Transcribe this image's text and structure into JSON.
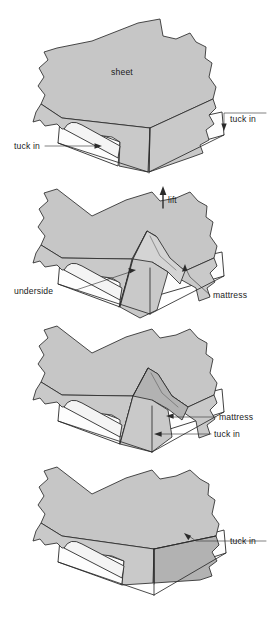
{
  "figure": {
    "panel_count": 4,
    "colors": {
      "sheet_fill": "#c9c9c9",
      "sheet_shadow": "#b2b2b2",
      "sheet_highlight": "#d4d4d4",
      "mattress_fill": "#fdfdfd",
      "outline": "#2b2b2b",
      "background": "#ffffff",
      "label_text": "#1b1b1b"
    }
  },
  "panels": [
    {
      "index": 1,
      "name": "panel-sheet-draped",
      "labels": {
        "sheet": "sheet",
        "tuck_in_right": "tuck in",
        "tuck_in_left": "tuck in"
      }
    },
    {
      "index": 2,
      "name": "panel-lift-fold",
      "labels": {
        "lift": "lift",
        "underside": "underside",
        "mattress": "mattress"
      }
    },
    {
      "index": 3,
      "name": "panel-fold-down",
      "labels": {
        "mattress": "mattress",
        "tuck_in": "tuck in"
      }
    },
    {
      "index": 4,
      "name": "panel-finished-corner",
      "labels": {
        "tuck_in": "tuck in"
      }
    }
  ],
  "icons": {
    "lift_arrow": "up-arrow-icon"
  }
}
